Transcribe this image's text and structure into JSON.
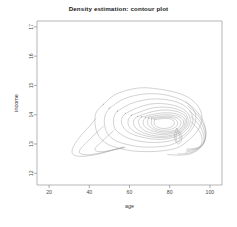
{
  "chart_data": {
    "type": "contour",
    "title": "Density estimation: contour plot",
    "xlabel": "age",
    "ylabel": "income",
    "xlim": [
      14,
      106
    ],
    "ylim": [
      11.6,
      17.2
    ],
    "xticks": [
      20,
      40,
      60,
      80,
      100
    ],
    "yticks": [
      12,
      13,
      14,
      15,
      16,
      17
    ],
    "xtick_labels": [
      "20",
      "40",
      "60",
      "80",
      "100"
    ],
    "ytick_labels": [
      "12",
      "13",
      "14",
      "15",
      "16",
      "17"
    ],
    "grid": false,
    "legend": false,
    "n_levels": 11,
    "peak": {
      "age": 70,
      "income": 13.8
    },
    "contours": [
      {
        "level": 1,
        "points": [
          [
            47,
            14.35
          ],
          [
            52,
            14.65
          ],
          [
            58,
            14.82
          ],
          [
            66,
            14.92
          ],
          [
            74,
            14.88
          ],
          [
            82,
            14.78
          ],
          [
            89,
            14.6
          ],
          [
            94,
            14.3
          ],
          [
            96,
            13.95
          ],
          [
            95,
            13.6
          ],
          [
            92,
            13.3
          ],
          [
            88,
            13.05
          ],
          [
            84,
            12.88
          ],
          [
            78,
            12.78
          ],
          [
            70,
            12.74
          ],
          [
            62,
            12.76
          ],
          [
            55,
            12.85
          ],
          [
            49,
            13.0
          ],
          [
            45,
            13.25
          ],
          [
            43,
            13.6
          ],
          [
            43,
            13.98
          ],
          [
            44.6,
            14.2
          ],
          [
            47,
            14.35
          ]
        ]
      },
      {
        "level": 2,
        "points": [
          [
            50,
            14.22
          ],
          [
            56,
            14.5
          ],
          [
            63,
            14.66
          ],
          [
            71,
            14.72
          ],
          [
            79,
            14.66
          ],
          [
            86,
            14.5
          ],
          [
            91,
            14.25
          ],
          [
            93,
            13.95
          ],
          [
            92,
            13.62
          ],
          [
            89,
            13.34
          ],
          [
            85,
            13.12
          ],
          [
            80,
            12.96
          ],
          [
            73,
            12.9
          ],
          [
            66,
            12.9
          ],
          [
            59,
            12.98
          ],
          [
            53,
            13.12
          ],
          [
            49,
            13.36
          ],
          [
            47.5,
            13.7
          ],
          [
            48,
            14.0
          ],
          [
            50,
            14.22
          ]
        ]
      },
      {
        "level": 3,
        "points": [
          [
            54,
            14.12
          ],
          [
            60,
            14.36
          ],
          [
            67,
            14.5
          ],
          [
            74,
            14.54
          ],
          [
            81,
            14.48
          ],
          [
            87,
            14.32
          ],
          [
            90.5,
            14.08
          ],
          [
            91.5,
            13.8
          ],
          [
            90,
            13.52
          ],
          [
            87,
            13.3
          ],
          [
            82,
            13.14
          ],
          [
            76,
            13.06
          ],
          [
            69,
            13.06
          ],
          [
            62,
            13.14
          ],
          [
            57,
            13.28
          ],
          [
            53,
            13.5
          ],
          [
            52,
            13.78
          ],
          [
            52.7,
            14.0
          ],
          [
            54,
            14.12
          ]
        ]
      },
      {
        "level": 4,
        "points": [
          [
            58,
            14.04
          ],
          [
            64,
            14.24
          ],
          [
            70,
            14.36
          ],
          [
            76,
            14.38
          ],
          [
            82,
            14.32
          ],
          [
            87,
            14.18
          ],
          [
            89.8,
            13.96
          ],
          [
            90,
            13.7
          ],
          [
            88,
            13.46
          ],
          [
            84,
            13.28
          ],
          [
            79,
            13.18
          ],
          [
            73,
            13.16
          ],
          [
            67,
            13.22
          ],
          [
            62,
            13.32
          ],
          [
            58,
            13.48
          ],
          [
            56,
            13.72
          ],
          [
            56.5,
            13.92
          ],
          [
            58,
            14.04
          ]
        ]
      },
      {
        "level": 5,
        "points": [
          [
            61,
            13.98
          ],
          [
            67,
            14.14
          ],
          [
            72,
            14.24
          ],
          [
            78,
            14.26
          ],
          [
            83,
            14.2
          ],
          [
            87.5,
            14.06
          ],
          [
            89,
            13.86
          ],
          [
            88.8,
            13.64
          ],
          [
            86,
            13.42
          ],
          [
            82,
            13.28
          ],
          [
            77,
            13.22
          ],
          [
            71,
            13.24
          ],
          [
            66,
            13.32
          ],
          [
            62,
            13.44
          ],
          [
            59.5,
            13.64
          ],
          [
            59.5,
            13.84
          ],
          [
            61,
            13.98
          ]
        ]
      },
      {
        "level": 6,
        "points": [
          [
            64,
            13.94
          ],
          [
            69,
            14.06
          ],
          [
            74,
            14.14
          ],
          [
            79,
            14.16
          ],
          [
            84,
            14.1
          ],
          [
            87.6,
            13.96
          ],
          [
            88.4,
            13.78
          ],
          [
            87.6,
            13.58
          ],
          [
            85,
            13.4
          ],
          [
            81,
            13.3
          ],
          [
            76,
            13.26
          ],
          [
            71,
            13.3
          ],
          [
            67,
            13.38
          ],
          [
            63.5,
            13.52
          ],
          [
            62,
            13.7
          ],
          [
            62.5,
            13.86
          ],
          [
            64,
            13.94
          ]
        ]
      },
      {
        "level": 7,
        "points": [
          [
            66,
            13.92
          ],
          [
            71,
            14.0
          ],
          [
            76,
            14.06
          ],
          [
            80.5,
            14.06
          ],
          [
            84.6,
            14.0
          ],
          [
            87.2,
            13.88
          ],
          [
            87.6,
            13.72
          ],
          [
            86.6,
            13.56
          ],
          [
            84,
            13.42
          ],
          [
            80,
            13.34
          ],
          [
            76,
            13.32
          ],
          [
            72,
            13.36
          ],
          [
            68,
            13.44
          ],
          [
            65.5,
            13.58
          ],
          [
            64.5,
            13.74
          ],
          [
            65,
            13.86
          ],
          [
            66,
            13.92
          ]
        ]
      },
      {
        "level": 8,
        "points": [
          [
            68,
            13.9
          ],
          [
            72.5,
            13.96
          ],
          [
            77,
            14.0
          ],
          [
            81,
            13.99
          ],
          [
            84.6,
            13.93
          ],
          [
            86.6,
            13.82
          ],
          [
            86.8,
            13.68
          ],
          [
            85.6,
            13.54
          ],
          [
            83,
            13.44
          ],
          [
            79.5,
            13.38
          ],
          [
            76,
            13.37
          ],
          [
            72.5,
            13.42
          ],
          [
            69.5,
            13.5
          ],
          [
            67.3,
            13.62
          ],
          [
            66.8,
            13.76
          ],
          [
            67.3,
            13.85
          ],
          [
            68,
            13.9
          ]
        ]
      },
      {
        "level": 9,
        "points": [
          [
            69.5,
            13.88
          ],
          [
            73.5,
            13.92
          ],
          [
            77.5,
            13.95
          ],
          [
            81,
            13.94
          ],
          [
            83.8,
            13.88
          ],
          [
            85.4,
            13.78
          ],
          [
            85.5,
            13.66
          ],
          [
            84.3,
            13.54
          ],
          [
            82,
            13.46
          ],
          [
            79,
            13.42
          ],
          [
            76,
            13.42
          ],
          [
            73,
            13.47
          ],
          [
            70.8,
            13.55
          ],
          [
            69.3,
            13.66
          ],
          [
            69,
            13.78
          ],
          [
            69.5,
            13.88
          ]
        ]
      },
      {
        "level": 10,
        "points": [
          [
            71,
            13.86
          ],
          [
            74.5,
            13.89
          ],
          [
            78,
            13.91
          ],
          [
            80.8,
            13.9
          ],
          [
            82.8,
            13.84
          ],
          [
            83.9,
            13.75
          ],
          [
            83.8,
            13.65
          ],
          [
            82.6,
            13.56
          ],
          [
            80.5,
            13.5
          ],
          [
            78,
            13.47
          ],
          [
            75.5,
            13.48
          ],
          [
            73,
            13.53
          ],
          [
            71.5,
            13.61
          ],
          [
            70.8,
            13.71
          ],
          [
            71,
            13.81
          ],
          [
            71,
            13.86
          ]
        ]
      },
      {
        "level": 11,
        "points": [
          [
            72.5,
            13.83
          ],
          [
            75.5,
            13.86
          ],
          [
            78.5,
            13.87
          ],
          [
            80.8,
            13.85
          ],
          [
            82,
            13.78
          ],
          [
            82.3,
            13.69
          ],
          [
            81.4,
            13.61
          ],
          [
            79.5,
            13.55
          ],
          [
            77,
            13.53
          ],
          [
            74.5,
            13.56
          ],
          [
            72.8,
            13.63
          ],
          [
            72.2,
            13.72
          ],
          [
            72.5,
            13.83
          ]
        ]
      }
    ],
    "tail_contours": [
      {
        "level": 1,
        "points": [
          [
            43,
            13.85
          ],
          [
            40,
            13.6
          ],
          [
            36,
            13.3
          ],
          [
            33,
            13.02
          ],
          [
            31.5,
            12.8
          ],
          [
            32,
            12.64
          ],
          [
            35,
            12.58
          ],
          [
            40,
            12.6
          ],
          [
            46,
            12.68
          ],
          [
            52,
            12.8
          ],
          [
            58,
            12.88
          ]
        ]
      },
      {
        "level": 2,
        "points": [
          [
            47,
            13.6
          ],
          [
            43,
            13.35
          ],
          [
            39,
            13.08
          ],
          [
            36,
            12.86
          ],
          [
            35,
            12.72
          ],
          [
            37,
            12.64
          ],
          [
            41,
            12.64
          ],
          [
            46,
            12.7
          ],
          [
            52,
            12.8
          ],
          [
            57,
            12.9
          ]
        ]
      },
      {
        "level": 3,
        "points": [
          [
            52,
            13.45
          ],
          [
            48,
            13.2
          ],
          [
            45,
            13.0
          ],
          [
            43,
            12.86
          ],
          [
            43.5,
            12.76
          ],
          [
            47,
            12.74
          ],
          [
            52,
            12.8
          ],
          [
            57,
            12.88
          ]
        ]
      }
    ],
    "right_flank_contours": [
      {
        "level": 1,
        "points": [
          [
            88,
            14.45
          ],
          [
            93,
            14.15
          ],
          [
            96.5,
            13.8
          ],
          [
            98,
            13.42
          ],
          [
            97,
            13.05
          ],
          [
            94,
            12.8
          ],
          [
            90,
            12.66
          ],
          [
            85,
            12.62
          ],
          [
            79,
            12.64
          ]
        ]
      },
      {
        "level": 2,
        "points": [
          [
            89,
            14.3
          ],
          [
            94,
            13.98
          ],
          [
            97,
            13.64
          ],
          [
            98,
            13.3
          ],
          [
            96.5,
            12.98
          ],
          [
            93,
            12.78
          ],
          [
            89,
            12.68
          ],
          [
            84,
            12.66
          ]
        ]
      },
      {
        "level": 3,
        "points": [
          [
            90,
            14.12
          ],
          [
            94.5,
            13.82
          ],
          [
            97,
            13.5
          ],
          [
            97.6,
            13.2
          ],
          [
            96,
            12.95
          ],
          [
            92.5,
            12.8
          ],
          [
            88,
            12.72
          ]
        ]
      },
      {
        "level": 4,
        "points": [
          [
            90.5,
            13.95
          ],
          [
            94.5,
            13.66
          ],
          [
            96.6,
            13.38
          ],
          [
            97,
            13.12
          ],
          [
            95.4,
            12.92
          ],
          [
            92,
            12.82
          ],
          [
            88.5,
            12.78
          ]
        ]
      },
      {
        "level": 5,
        "points": [
          [
            90.6,
            13.76
          ],
          [
            94,
            13.52
          ],
          [
            95.8,
            13.28
          ],
          [
            96,
            13.06
          ],
          [
            94.6,
            12.9
          ],
          [
            91.5,
            12.84
          ],
          [
            88.5,
            12.83
          ]
        ]
      }
    ],
    "satellite_contours": [
      {
        "level": 1,
        "points": [
          [
            83.5,
            13.52
          ],
          [
            85,
            13.4
          ],
          [
            86,
            13.24
          ],
          [
            85.6,
            13.08
          ],
          [
            84.2,
            13.0
          ],
          [
            82.8,
            13.1
          ],
          [
            82.4,
            13.28
          ],
          [
            82.9,
            13.44
          ],
          [
            83.5,
            13.52
          ]
        ]
      },
      {
        "level": 2,
        "points": [
          [
            83.8,
            13.42
          ],
          [
            84.8,
            13.32
          ],
          [
            85.2,
            13.2
          ],
          [
            84.7,
            13.1
          ],
          [
            83.8,
            13.07
          ],
          [
            83.2,
            13.18
          ],
          [
            83.3,
            13.33
          ],
          [
            83.8,
            13.42
          ]
        ]
      }
    ]
  }
}
